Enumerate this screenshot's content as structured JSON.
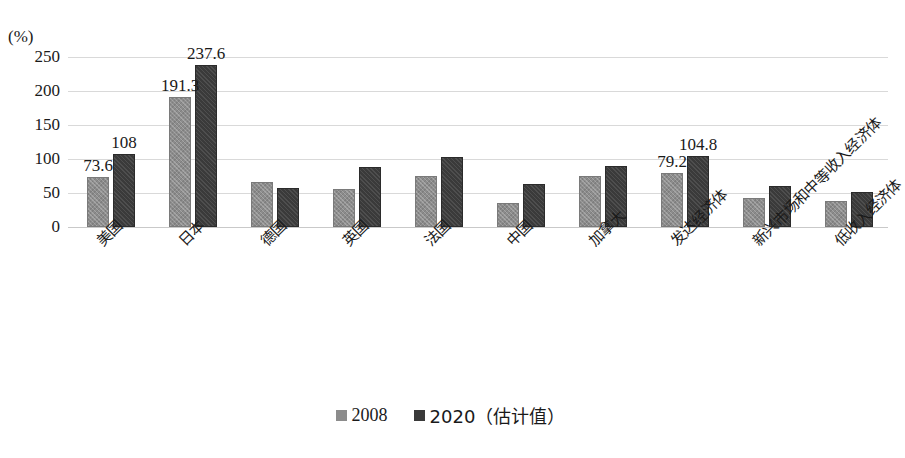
{
  "chart_data": {
    "type": "bar",
    "title": "",
    "xlabel": "",
    "ylabel": "(%)",
    "ylim": [
      0,
      250
    ],
    "yticks": [
      250,
      200,
      150,
      100,
      50,
      0
    ],
    "grid": true,
    "legend_position": "bottom",
    "categories": [
      "美国",
      "日本",
      "德国",
      "英国",
      "法国",
      "中国",
      "加拿大",
      "发达经济体",
      "新兴市场和中等收入经济体",
      "低收入经济体"
    ],
    "series": [
      {
        "name": "2008",
        "color": "#8c8c8c",
        "values": [
          73.6,
          191.3,
          66,
          56,
          75,
          36,
          75,
          79.2,
          43,
          38
        ]
      },
      {
        "name": "2020（估计值）",
        "color": "#3a3a3a",
        "values": [
          108,
          237.6,
          57,
          88,
          103,
          63,
          90,
          104.8,
          61,
          51
        ]
      }
    ],
    "point_labels": [
      {
        "group": 0,
        "series": 0,
        "text": "73.6"
      },
      {
        "group": 0,
        "series": 1,
        "text": "108"
      },
      {
        "group": 1,
        "series": 0,
        "text": "191.3"
      },
      {
        "group": 1,
        "series": 1,
        "text": "237.6"
      },
      {
        "group": 7,
        "series": 0,
        "text": "79.2"
      },
      {
        "group": 7,
        "series": 1,
        "text": "104.8"
      }
    ]
  },
  "axis": {
    "unit_label": "(%)",
    "ticks": [
      "250",
      "200",
      "150",
      "100",
      "50",
      "0"
    ]
  },
  "legend": {
    "items": [
      {
        "label": "2008",
        "swatch": "s2008"
      },
      {
        "label": "2020（估计值）",
        "swatch": "s2020"
      }
    ]
  }
}
